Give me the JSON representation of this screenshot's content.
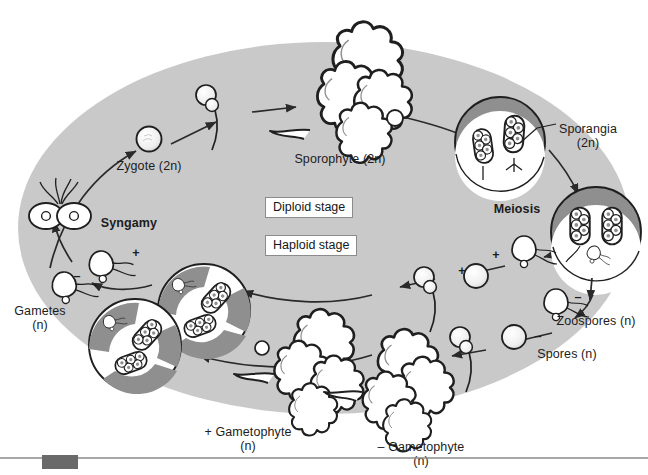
{
  "diagram": {
    "canvas": {
      "width": 648,
      "height": 475
    },
    "background_color": "#ffffff",
    "ellipse_fill": "#c9c9c9",
    "ink_color": "#1c1c1c",
    "organelle_fill": "#8f8f8f"
  },
  "legend": {
    "items": [
      {
        "key": "diploid",
        "label": "Diploid stage",
        "x": 300,
        "y": 197
      },
      {
        "key": "haploid",
        "label": "Haploid stage",
        "x": 300,
        "y": 235
      }
    ]
  },
  "labels": [
    {
      "key": "zygote",
      "text": "Zygote (2n)",
      "x": 149,
      "y": 160,
      "align": "center",
      "bold": false
    },
    {
      "key": "sporophyte",
      "text": "Sporophyte (2n)",
      "x": 340,
      "y": 153,
      "align": "center",
      "bold": false
    },
    {
      "key": "sporangia",
      "text": "Sporangia\n(2n)",
      "x": 588,
      "y": 123,
      "align": "center",
      "bold": false
    },
    {
      "key": "meiosis",
      "text": "Meiosis",
      "x": 517,
      "y": 203,
      "align": "center",
      "bold": true
    },
    {
      "key": "syngamy",
      "text": "Syngamy",
      "x": 129,
      "y": 217,
      "align": "center",
      "bold": true
    },
    {
      "key": "gametes",
      "text": "Gametes\n(n)",
      "x": 40,
      "y": 305,
      "align": "center",
      "bold": false
    },
    {
      "key": "zoospores",
      "text": "Zoospores (n)",
      "x": 596,
      "y": 315,
      "align": "center",
      "bold": false
    },
    {
      "key": "spores",
      "text": "Spores (n)",
      "x": 567,
      "y": 348,
      "align": "center",
      "bold": false
    },
    {
      "key": "plus-gameto",
      "text": "+ Gametophyte\n(n)",
      "x": 248,
      "y": 426,
      "align": "center",
      "bold": false
    },
    {
      "key": "minus-gameto",
      "text": "– Gametophyte\n(n)",
      "x": 421,
      "y": 441,
      "align": "center",
      "bold": false
    }
  ],
  "sign_marks": [
    {
      "key": "syngamy-plus",
      "text": "+",
      "x": 136,
      "y": 247
    },
    {
      "key": "syngamy-minus",
      "text": "–",
      "x": 77,
      "y": 270
    },
    {
      "key": "meiosis-plus",
      "text": "+",
      "x": 496,
      "y": 249
    },
    {
      "key": "spore-plus",
      "text": "+",
      "x": 462,
      "y": 265
    },
    {
      "key": "meiosis-minus",
      "text": "–",
      "x": 578,
      "y": 291
    },
    {
      "key": "spore-minus",
      "text": "–",
      "x": 538,
      "y": 330
    }
  ],
  "footer": {
    "rule_color": "#8a8a8a",
    "block_color": "#6a6a6a",
    "rule_y": 458,
    "block": {
      "x": 42,
      "y": 455,
      "width": 36,
      "height": 14
    }
  }
}
